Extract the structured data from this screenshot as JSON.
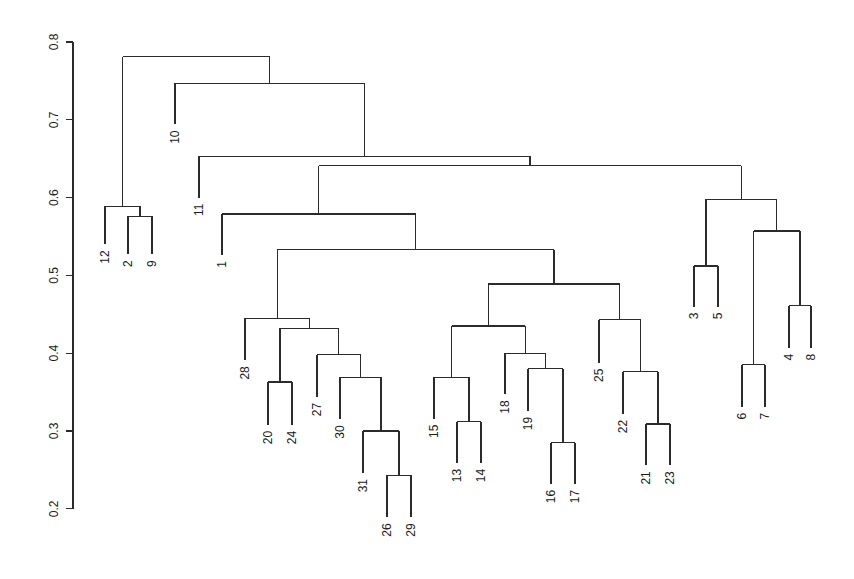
{
  "chart_data": {
    "type": "dendrogram",
    "title": "",
    "xlabel": "",
    "ylabel": "",
    "ylim": [
      0.2,
      0.8
    ],
    "grid": false,
    "legend": null,
    "yticks": [
      0.2,
      0.3,
      0.4,
      0.5,
      0.6,
      0.7,
      0.8
    ],
    "ytick_labels": [
      "0.2",
      "0.3",
      "0.4",
      "0.5",
      "0.6",
      "0.7",
      "0.8"
    ],
    "leaf_order": [
      "12",
      "2",
      "9",
      "10",
      "11",
      "1",
      "28",
      "20",
      "24",
      "27",
      "30",
      "31",
      "26",
      "29",
      "15",
      "13",
      "14",
      "18",
      "19",
      "16",
      "17",
      "25",
      "22",
      "21",
      "23",
      "3",
      "5",
      "6",
      "7",
      "4",
      "8"
    ],
    "leaves": [
      {
        "label": "12",
        "x": 105,
        "h": 0.54
      },
      {
        "label": "2",
        "x": 128,
        "h": 0.527
      },
      {
        "label": "9",
        "x": 152,
        "h": 0.527
      },
      {
        "label": "10",
        "x": 175,
        "h": 0.694
      },
      {
        "label": "11",
        "x": 199,
        "h": 0.6
      },
      {
        "label": "1",
        "x": 222,
        "h": 0.526
      },
      {
        "label": "28",
        "x": 245,
        "h": 0.391
      },
      {
        "label": "20",
        "x": 268,
        "h": 0.308
      },
      {
        "label": "24",
        "x": 292,
        "h": 0.308
      },
      {
        "label": "27",
        "x": 317,
        "h": 0.344
      },
      {
        "label": "30",
        "x": 340,
        "h": 0.315
      },
      {
        "label": "31",
        "x": 363,
        "h": 0.246
      },
      {
        "label": "26",
        "x": 387,
        "h": 0.189
      },
      {
        "label": "29",
        "x": 411,
        "h": 0.189
      },
      {
        "label": "15",
        "x": 434,
        "h": 0.316
      },
      {
        "label": "13",
        "x": 457,
        "h": 0.259
      },
      {
        "label": "14",
        "x": 481,
        "h": 0.259
      },
      {
        "label": "18",
        "x": 505,
        "h": 0.347
      },
      {
        "label": "19",
        "x": 528,
        "h": 0.326
      },
      {
        "label": "16",
        "x": 551,
        "h": 0.232
      },
      {
        "label": "17",
        "x": 575,
        "h": 0.232
      },
      {
        "label": "25",
        "x": 599,
        "h": 0.388
      },
      {
        "label": "22",
        "x": 623,
        "h": 0.322
      },
      {
        "label": "21",
        "x": 646,
        "h": 0.256
      },
      {
        "label": "23",
        "x": 670,
        "h": 0.256
      },
      {
        "label": "3",
        "x": 694,
        "h": 0.46
      },
      {
        "label": "5",
        "x": 718,
        "h": 0.46
      },
      {
        "label": "6",
        "x": 742,
        "h": 0.331
      },
      {
        "label": "7",
        "x": 765,
        "h": 0.331
      },
      {
        "label": "4",
        "x": 789,
        "h": 0.407
      },
      {
        "label": "8",
        "x": 811,
        "h": 0.407
      }
    ],
    "merges": [
      {
        "id": "m_2_9",
        "height": 0.576,
        "left": "2",
        "right": "9"
      },
      {
        "id": "m_12",
        "height": 0.589,
        "left": "12",
        "right": "m_2_9"
      },
      {
        "id": "m_26_29",
        "height": 0.243,
        "left": "26",
        "right": "29"
      },
      {
        "id": "m_31",
        "height": 0.3,
        "left": "31",
        "right": "m_26_29"
      },
      {
        "id": "m_30",
        "height": 0.369,
        "left": "30",
        "right": "m_31"
      },
      {
        "id": "m_27",
        "height": 0.398,
        "left": "27",
        "right": "m_30"
      },
      {
        "id": "m_20_24",
        "height": 0.363,
        "left": "20",
        "right": "24"
      },
      {
        "id": "m_2024_27",
        "height": 0.432,
        "left": "m_20_24",
        "right": "m_27"
      },
      {
        "id": "m_28",
        "height": 0.445,
        "left": "28",
        "right": "m_2024_27"
      },
      {
        "id": "m_13_14",
        "height": 0.312,
        "left": "13",
        "right": "14"
      },
      {
        "id": "m_15",
        "height": 0.369,
        "left": "15",
        "right": "m_13_14"
      },
      {
        "id": "m_16_17",
        "height": 0.285,
        "left": "16",
        "right": "17"
      },
      {
        "id": "m_19",
        "height": 0.38,
        "left": "19",
        "right": "m_16_17"
      },
      {
        "id": "m_18",
        "height": 0.4,
        "left": "18",
        "right": "m_19"
      },
      {
        "id": "m_15_18",
        "height": 0.435,
        "left": "m_15",
        "right": "m_18"
      },
      {
        "id": "m_21_23",
        "height": 0.309,
        "left": "21",
        "right": "23"
      },
      {
        "id": "m_22",
        "height": 0.376,
        "left": "22",
        "right": "m_21_23"
      },
      {
        "id": "m_25",
        "height": 0.443,
        "left": "25",
        "right": "m_22"
      },
      {
        "id": "m_mid",
        "height": 0.489,
        "left": "m_15_18",
        "right": "m_25"
      },
      {
        "id": "m_28_mid",
        "height": 0.533,
        "left": "m_28",
        "right": "m_mid"
      },
      {
        "id": "m_1",
        "height": 0.579,
        "left": "1",
        "right": "m_28_mid"
      },
      {
        "id": "m_3_5",
        "height": 0.512,
        "left": "3",
        "right": "5"
      },
      {
        "id": "m_6_7",
        "height": 0.385,
        "left": "6",
        "right": "7"
      },
      {
        "id": "m_4_8",
        "height": 0.461,
        "left": "4",
        "right": "8"
      },
      {
        "id": "m_67_48",
        "height": 0.557,
        "left": "m_6_7",
        "right": "m_4_8"
      },
      {
        "id": "m_right",
        "height": 0.598,
        "left": "m_3_5",
        "right": "m_67_48"
      },
      {
        "id": "m_1_right",
        "height": 0.641,
        "left": "m_1",
        "right": "m_right"
      },
      {
        "id": "m_11",
        "height": 0.653,
        "left": "11",
        "right": "m_1_right"
      },
      {
        "id": "m_10",
        "height": 0.747,
        "left": "10",
        "right": "m_11"
      },
      {
        "id": "m_root",
        "height": 0.781,
        "left": "m_12",
        "right": "m_10"
      }
    ]
  },
  "layout": {
    "axis_x": 73,
    "y_top_px": 42,
    "px_per_unit": 778,
    "y_top_value": 0.8,
    "line_color": "#2b2b2b",
    "label_color": "#1a1a1a"
  }
}
